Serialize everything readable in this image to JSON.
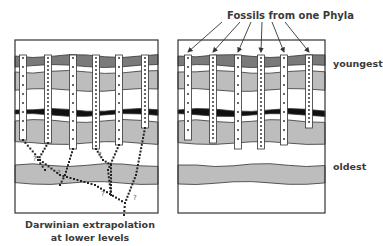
{
  "labels": {
    "top_title": "Fossils from one Phyla",
    "youngest": "youngest",
    "oldest": "oldest",
    "caption_line1": "Darwinian extrapolation",
    "caption_line2": "at lower levels"
  },
  "colors": {
    "dark_gray": "#7a7a7a",
    "light_gray": "#bdbdbd",
    "black_band": "#111111",
    "white": "#ffffff",
    "outline": "#333333",
    "dots": "#222222"
  },
  "panels": [
    {
      "name": "left-panel",
      "x": 15,
      "y": 40,
      "w": 143,
      "h": 173,
      "columns_x": [
        23,
        48,
        73,
        96,
        119,
        145
      ],
      "columns_bottom": [
        140,
        143,
        149,
        149,
        145,
        128
      ]
    },
    {
      "name": "right-panel",
      "x": 178,
      "y": 40,
      "w": 147,
      "h": 173,
      "columns_x": [
        188,
        213,
        238,
        261,
        284,
        309
      ],
      "columns_bottom": [
        140,
        143,
        149,
        149,
        145,
        128
      ]
    }
  ],
  "question_marks": [
    {
      "x": 33,
      "y": 161
    },
    {
      "x": 57,
      "y": 175
    },
    {
      "x": 98,
      "y": 157
    },
    {
      "x": 101,
      "y": 196
    },
    {
      "x": 133,
      "y": 200
    }
  ],
  "arrow_targets_x": [
    188,
    213,
    238,
    261,
    284,
    309
  ]
}
